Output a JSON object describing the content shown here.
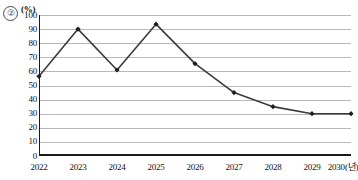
{
  "figure": {
    "item_number": "②",
    "unit_label": "(%)"
  },
  "chart_data": {
    "type": "line",
    "title": "",
    "xlabel": "2030(년)",
    "ylabel": "(%)",
    "categories": [
      "2022",
      "2023",
      "2024",
      "2025",
      "2026",
      "2027",
      "2028",
      "2029",
      "2030"
    ],
    "x_tick_labels": [
      "2022",
      "2023",
      "2024",
      "2025",
      "2026",
      "2027",
      "2028",
      "2029",
      "2030(년)"
    ],
    "values": [
      56.5,
      90,
      61,
      93.5,
      65.5,
      45,
      35,
      30,
      30
    ],
    "y_tick_labels": [
      "100",
      "90",
      "80",
      "70",
      "60",
      "50",
      "40",
      "30",
      "20",
      "10",
      "0"
    ],
    "y_ticks": [
      100,
      90,
      80,
      70,
      60,
      50,
      40,
      30,
      20,
      10,
      0
    ],
    "ylim": [
      0,
      100
    ],
    "grid": "horizontal",
    "legend": "none",
    "series": [
      {
        "name": "series-1",
        "values": [
          56.5,
          90,
          61,
          93.5,
          65.5,
          45,
          35,
          30,
          30
        ],
        "line_color": "#3b3b3b",
        "marker": "diamond",
        "marker_color": "#1f1f1f"
      }
    ],
    "colors": {
      "line": "#3b3b3b",
      "marker": "#1f1f1f",
      "grid": "#b9b9b9",
      "axis": "#1a1a1a",
      "text": "#111111"
    }
  }
}
